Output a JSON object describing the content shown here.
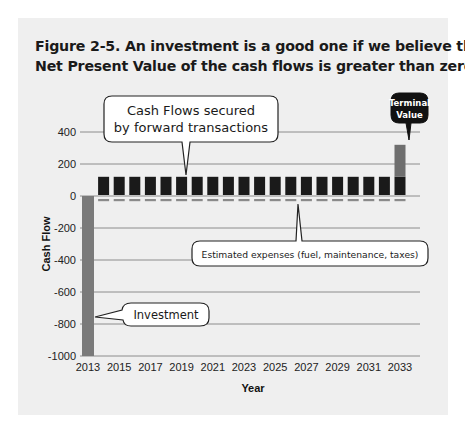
{
  "figure": {
    "title_line1": "Figure 2-5. An investment is a good one if we believe the",
    "title_line2": "Net Present Value of the cash flows is greater than zero."
  },
  "annotations": {
    "cash_flows_line1": "Cash Flows secured",
    "cash_flows_line2": "by forward transactions",
    "terminal_line1": "Terminal",
    "terminal_line2": "Value",
    "expenses": "Estimated expenses (fuel, maintenance, taxes)",
    "investment": "Investment"
  },
  "colors": {
    "background_panel": "#efefef",
    "cash_flow_bar": "#1a1a1a",
    "investment_bar": "#7a7a7a",
    "terminal_bar": "#6e6e6e",
    "expense_bar": "#8a8a8a",
    "gridline": "#8c8c8c"
  },
  "chart_data": {
    "type": "bar",
    "title": "Figure 2-5. An investment is a good one if we believe the Net Present Value of the cash flows is greater than zero.",
    "xlabel": "Year",
    "ylabel": "Cash Flow",
    "ylim": [
      -1000,
      400
    ],
    "yticks": [
      400,
      200,
      0,
      -200,
      -400,
      -600,
      -800,
      -1000
    ],
    "xticks": [
      2013,
      2015,
      2017,
      2019,
      2021,
      2023,
      2025,
      2027,
      2029,
      2031,
      2033
    ],
    "grid": true,
    "categories": [
      2013,
      2014,
      2015,
      2016,
      2017,
      2018,
      2019,
      2020,
      2021,
      2022,
      2023,
      2024,
      2025,
      2026,
      2027,
      2028,
      2029,
      2030,
      2031,
      2032,
      2033
    ],
    "series": [
      {
        "name": "Investment",
        "values": [
          -1000,
          0,
          0,
          0,
          0,
          0,
          0,
          0,
          0,
          0,
          0,
          0,
          0,
          0,
          0,
          0,
          0,
          0,
          0,
          0,
          0
        ]
      },
      {
        "name": "Cash Flows secured by forward transactions",
        "values": [
          0,
          120,
          120,
          120,
          120,
          120,
          120,
          120,
          120,
          120,
          120,
          120,
          120,
          120,
          120,
          120,
          120,
          120,
          120,
          120,
          120
        ]
      },
      {
        "name": "Estimated expenses (fuel, maintenance, taxes)",
        "values": [
          0,
          -30,
          -30,
          -30,
          -30,
          -30,
          -30,
          -30,
          -30,
          -30,
          -30,
          -30,
          -30,
          -30,
          -30,
          -30,
          -30,
          -30,
          -30,
          -30,
          -30
        ]
      },
      {
        "name": "Terminal Value",
        "values": [
          0,
          0,
          0,
          0,
          0,
          0,
          0,
          0,
          0,
          0,
          0,
          0,
          0,
          0,
          0,
          0,
          0,
          0,
          0,
          0,
          200
        ]
      }
    ],
    "annotations": [
      "Cash Flows secured by forward transactions",
      "Terminal Value",
      "Estimated expenses (fuel, maintenance, taxes)",
      "Investment"
    ]
  }
}
